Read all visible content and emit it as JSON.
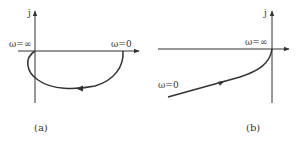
{
  "panels": [
    {
      "id": "a",
      "caption": "(a)",
      "imag_axis_label": "j",
      "start_label": "ω=0",
      "end_label": "ω=∞",
      "description": "Nyquist plot starting at ω=0 on positive real axis, sweeping clockwise through lower half-plane into third quadrant, ending at origin as ω=∞"
    },
    {
      "id": "b",
      "caption": "(b)",
      "imag_axis_label": "j",
      "start_label": "ω=0",
      "end_label": "ω=∞",
      "description": "Nyquist plot starting at ω=0 in third quadrant far left-bottom, rising toward origin, ending at origin as ω=∞"
    }
  ],
  "colors": {
    "stroke": "#333333",
    "background": "#ffffff"
  }
}
